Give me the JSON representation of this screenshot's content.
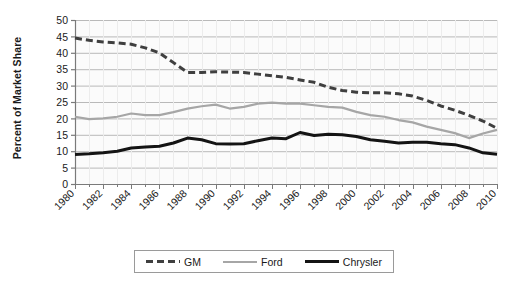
{
  "chart_data": {
    "type": "line",
    "title": "",
    "xlabel": "",
    "ylabel": "Percent of Market Share",
    "xlim": [
      1980,
      2010
    ],
    "ylim": [
      0,
      50
    ],
    "ytick_step": 5,
    "xtick_step": 2,
    "grid": true,
    "legend_position": "bottom",
    "yticks": [
      "0",
      "5",
      "10",
      "15",
      "20",
      "25",
      "30",
      "35",
      "40",
      "45",
      "50"
    ],
    "xticks": [
      "1980",
      "1982",
      "1984",
      "1986",
      "1988",
      "1990",
      "1992",
      "1994",
      "1996",
      "1998",
      "2000",
      "2002",
      "2004",
      "2006",
      "2008",
      "2010"
    ],
    "x": [
      1980,
      1981,
      1982,
      1983,
      1984,
      1985,
      1986,
      1987,
      1988,
      1989,
      1990,
      1991,
      1992,
      1993,
      1994,
      1995,
      1996,
      1997,
      1998,
      1999,
      2000,
      2001,
      2002,
      2003,
      2004,
      2005,
      2006,
      2007,
      2008,
      2009,
      2010
    ],
    "series": [
      {
        "name": "GM",
        "color": "#3f3f3f",
        "style": "dashed",
        "width": 3.0,
        "values": [
          44.5,
          43.8,
          43.3,
          43.0,
          42.6,
          41.5,
          40.0,
          37.0,
          34.0,
          34.0,
          34.2,
          34.1,
          34.0,
          33.5,
          33.0,
          32.5,
          31.7,
          31.0,
          29.5,
          28.5,
          28.0,
          27.8,
          27.8,
          27.5,
          26.8,
          25.5,
          23.8,
          22.5,
          20.9,
          19.2,
          17.0
        ]
      },
      {
        "name": "Ford",
        "color": "#a6a6a6",
        "style": "solid",
        "width": 2.2,
        "values": [
          20.5,
          19.8,
          20.0,
          20.5,
          21.5,
          21.0,
          21.0,
          21.9,
          23.0,
          23.7,
          24.2,
          23.0,
          23.5,
          24.5,
          24.8,
          24.5,
          24.5,
          24.0,
          23.5,
          23.3,
          22.0,
          21.0,
          20.5,
          19.5,
          18.8,
          17.5,
          16.5,
          15.5,
          14.0,
          15.4,
          16.5
        ]
      },
      {
        "name": "Chrysler",
        "color": "#141414",
        "style": "solid",
        "width": 3.0,
        "values": [
          9.0,
          9.2,
          9.5,
          10.0,
          11.0,
          11.3,
          11.5,
          12.5,
          14.0,
          13.5,
          12.3,
          12.2,
          12.3,
          13.2,
          14.0,
          13.8,
          15.7,
          14.8,
          15.2,
          15.0,
          14.5,
          13.5,
          13.0,
          12.5,
          12.7,
          12.7,
          12.3,
          12.0,
          11.0,
          9.5,
          9.1
        ]
      }
    ]
  },
  "legend": {
    "items": [
      {
        "label": "GM"
      },
      {
        "label": "Ford"
      },
      {
        "label": "Chrysler"
      }
    ]
  }
}
